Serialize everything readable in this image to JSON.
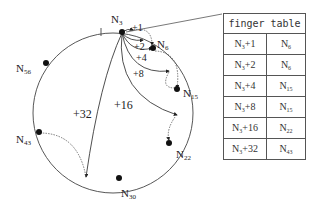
{
  "diagram": {
    "nodes": [
      {
        "name": "N",
        "sub": "3"
      },
      {
        "name": "N",
        "sub": "6"
      },
      {
        "name": "N",
        "sub": "15"
      },
      {
        "name": "N",
        "sub": "22"
      },
      {
        "name": "N",
        "sub": "30"
      },
      {
        "name": "N",
        "sub": "43"
      },
      {
        "name": "N",
        "sub": "56"
      }
    ],
    "edges": [
      "+1",
      "+2",
      "+4",
      "+8",
      "+16",
      "+32"
    ]
  },
  "finger_table": {
    "header": "finger table",
    "rows": [
      {
        "key": "N",
        "key_sub": "3",
        "key_suffix": "+1",
        "val": "N",
        "val_sub": "6"
      },
      {
        "key": "N",
        "key_sub": "3",
        "key_suffix": "+2",
        "val": "N",
        "val_sub": "6"
      },
      {
        "key": "N",
        "key_sub": "3",
        "key_suffix": "+4",
        "val": "N",
        "val_sub": "15"
      },
      {
        "key": "N",
        "key_sub": "3",
        "key_suffix": "+8",
        "val": "N",
        "val_sub": "15"
      },
      {
        "key": "N",
        "key_sub": "3",
        "key_suffix": "+16",
        "val": "N",
        "val_sub": "22"
      },
      {
        "key": "N",
        "key_sub": "3",
        "key_suffix": "+32",
        "val": "N",
        "val_sub": "43"
      }
    ]
  }
}
